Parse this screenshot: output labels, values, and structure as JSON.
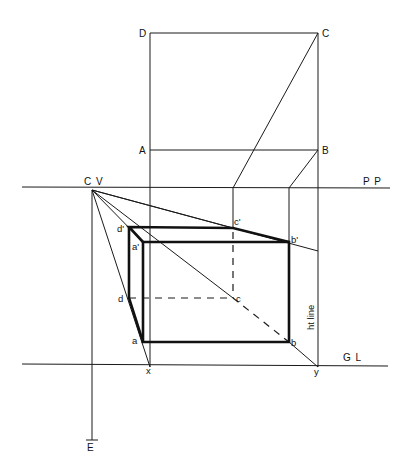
{
  "figure": {
    "plan_labels": {
      "D": "D",
      "C": "C",
      "A": "A",
      "B": "B"
    },
    "reference_lines": {
      "picture_plane": "P P",
      "ground_line": "G L",
      "center_of_vision": "C V",
      "eye": "E",
      "height_line": "ht line"
    },
    "perspective_labels": {
      "d_prime": "d'",
      "a_prime": "a'",
      "c_prime": "c'",
      "b_prime": "b'",
      "d": "d",
      "a": "a",
      "c": "c",
      "b": "b",
      "x": "x",
      "y": "y"
    },
    "colors": {
      "ink": "#111111",
      "paper": "#ffffff"
    }
  }
}
